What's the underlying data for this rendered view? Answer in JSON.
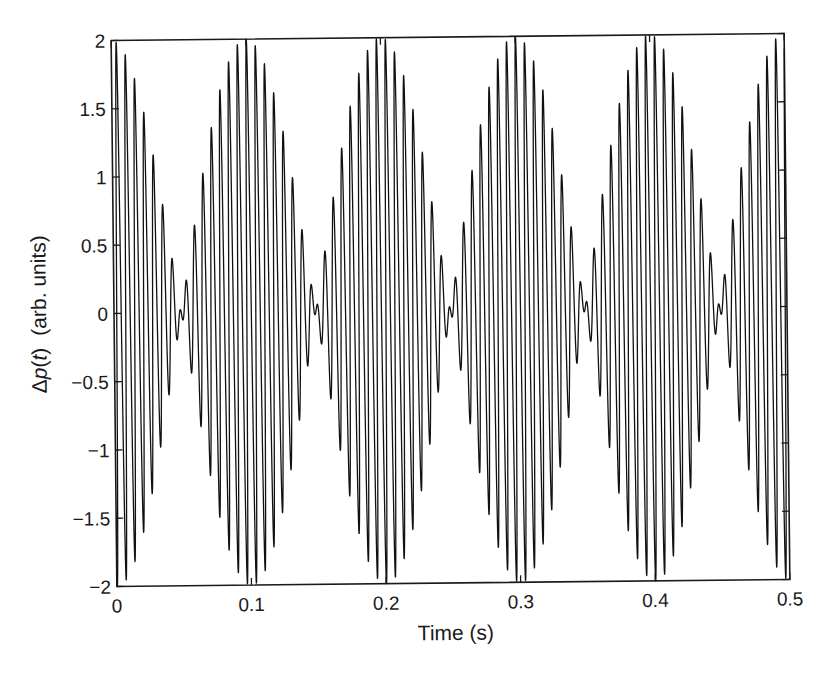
{
  "chart_data": {
    "type": "line",
    "title": "",
    "xlabel": "Time (s)",
    "ylabel": "Δp(t)  (arb. units)",
    "ylabel_parts": {
      "prefix": "Δ",
      "var": "p",
      "open": "(",
      "arg": "t",
      "close": ")",
      "units": "(arb. units)"
    },
    "xlim": [
      0,
      0.5
    ],
    "ylim": [
      -2,
      2
    ],
    "xticks": [
      0,
      0.1,
      0.2,
      0.3,
      0.4,
      0.5
    ],
    "xtick_labels": [
      "0",
      "0.1",
      "0.2",
      "0.3",
      "0.4",
      "0.5"
    ],
    "yticks": [
      2,
      1.5,
      1,
      0.5,
      0,
      -0.5,
      -1,
      -1.5,
      -2
    ],
    "ytick_labels": [
      "2",
      "1.5",
      "1",
      "0.5",
      "0",
      "−0.5",
      "−1",
      "−1.5",
      "−2"
    ],
    "grid": false,
    "legend": null,
    "series": [
      {
        "name": "Δp(t) — beats of two equal-amplitude tones",
        "color": "#111111",
        "model": "Δp(t) = sin(2π f1 t + φ) + sin(2π f2 t + φ)",
        "f1_hz": 145,
        "f2_hz": 155,
        "mean_frequency_hz": 150,
        "beat_frequency_hz": 10,
        "amplitude_each": 1,
        "phase_rad": -1.9,
        "envelope_maxima_t": [
          0,
          0.1,
          0.2,
          0.3,
          0.4,
          0.5
        ],
        "envelope_nodes_t": [
          0.05,
          0.15,
          0.25,
          0.35,
          0.45
        ],
        "peak_amplitude": 2
      }
    ]
  }
}
